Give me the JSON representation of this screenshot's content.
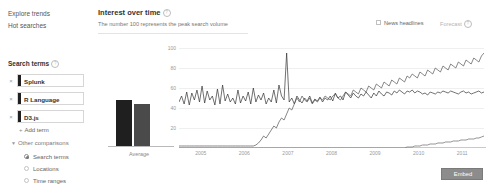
{
  "sidebar": {
    "nav": [
      {
        "label": "Explore trends"
      },
      {
        "label": "Hot searches"
      }
    ],
    "search_terms_heading": "Search terms",
    "help_glyph": "?",
    "remove_glyph": "×",
    "terms": [
      {
        "label": "Splunk",
        "color": "#1f1f1f"
      },
      {
        "label": "R Language",
        "color": "#1f1f1f"
      },
      {
        "label": "D3.js",
        "color": "#1f1f1f"
      }
    ],
    "add_term_label": "Add term",
    "add_term_glyph": "+",
    "other_comparisons_label": "Other comparisons",
    "other_comparisons_glyph": "▼",
    "comparison_options": [
      {
        "label": "Search terms",
        "selected": true
      },
      {
        "label": "Locations",
        "selected": false
      },
      {
        "label": "Time ranges",
        "selected": false
      }
    ]
  },
  "main": {
    "title": "Interest over time",
    "title_help_glyph": "?",
    "subtitle": "The number 100 represents the peak search volume",
    "news_headlines_label": "News headlines",
    "news_headlines_checked": false,
    "forecast_label": "Forecast",
    "forecast_help_glyph": "?",
    "embed_label": "Embed"
  },
  "chart_data": [
    {
      "type": "bar",
      "title": "",
      "categories": [
        "Average"
      ],
      "xlabel": "Average",
      "ylabel": "",
      "ylim": [
        0,
        100
      ],
      "series": [
        {
          "name": "Splunk",
          "values": [
            52
          ],
          "color": "#1f1f1f"
        },
        {
          "name": "R Language",
          "values": [
            48
          ],
          "color": "#4a4a4a"
        }
      ]
    },
    {
      "type": "line",
      "title": "Interest over time",
      "xlabel": "",
      "ylabel": "",
      "ylim": [
        0,
        100
      ],
      "yticks": [
        100,
        80,
        60,
        40,
        20
      ],
      "grid": true,
      "legend": "none",
      "x": [
        "2005",
        "2006",
        "2007",
        "2008",
        "2009",
        "2010",
        "2011"
      ],
      "xticks": [
        "2005",
        "2006",
        "2007",
        "2008",
        "2009",
        "2010",
        "2011"
      ],
      "series": [
        {
          "name": "Splunk",
          "color": "#333333",
          "values": [
            46,
            52,
            44,
            56,
            43,
            55,
            48,
            58,
            46,
            62,
            45,
            57,
            48,
            52,
            43,
            59,
            44,
            63,
            47,
            54,
            46,
            50,
            44,
            58,
            45,
            52,
            47,
            56,
            44,
            60,
            46,
            53,
            48,
            55,
            44,
            50,
            46,
            58,
            45,
            63,
            52,
            48,
            95,
            46,
            50,
            44,
            52,
            48,
            45,
            50,
            47,
            52,
            45,
            49,
            47,
            51,
            46,
            50,
            48,
            52,
            47,
            55,
            50,
            52,
            48,
            56,
            53,
            50,
            55,
            52,
            50,
            54,
            52,
            56,
            53,
            50,
            55,
            52,
            57,
            54,
            52,
            56,
            55,
            53,
            57,
            55,
            58,
            56,
            54,
            57,
            56,
            58,
            55,
            57,
            56,
            54,
            55,
            53,
            56,
            55,
            54,
            56,
            55,
            57,
            56,
            55,
            57,
            56,
            55,
            54,
            56,
            57,
            55,
            56,
            54,
            55,
            56,
            57,
            55,
            56
          ]
        },
        {
          "name": "R Language",
          "color": "#555555",
          "values": [
            2,
            2,
            2,
            2,
            2,
            2,
            2,
            2,
            2,
            2,
            2,
            2,
            2,
            2,
            2,
            2,
            2,
            2,
            2,
            2,
            2,
            2,
            2,
            2,
            2,
            2,
            2,
            2,
            2,
            2,
            3,
            5,
            8,
            12,
            10,
            14,
            18,
            22,
            20,
            26,
            30,
            28,
            34,
            40,
            38,
            44,
            50,
            46,
            52,
            48,
            46,
            50,
            44,
            48,
            46,
            50,
            48,
            52,
            50,
            48,
            52,
            54,
            50,
            48,
            52,
            56,
            54,
            52,
            58,
            56,
            54,
            60,
            58,
            56,
            62,
            60,
            58,
            64,
            62,
            60,
            66,
            64,
            62,
            68,
            66,
            64,
            70,
            68,
            66,
            72,
            70,
            74,
            72,
            70,
            76,
            74,
            72,
            78,
            76,
            74,
            80,
            78,
            76,
            82,
            80,
            78,
            84,
            82,
            80,
            86,
            84,
            82,
            88,
            86,
            84,
            90,
            88,
            86,
            92,
            95
          ]
        },
        {
          "name": "D3.js",
          "color": "#666666",
          "values": [
            0,
            0,
            0,
            0,
            0,
            0,
            0,
            0,
            0,
            0,
            0,
            0,
            0,
            0,
            0,
            0,
            0,
            0,
            0,
            0,
            0,
            0,
            0,
            0,
            0,
            0,
            0,
            0,
            0,
            0,
            0,
            0,
            0,
            0,
            0,
            0,
            0,
            0,
            0,
            0,
            0,
            0,
            0,
            0,
            0,
            0,
            0,
            0,
            0,
            0,
            0,
            0,
            0,
            0,
            0,
            0,
            0,
            0,
            0,
            0,
            0,
            0,
            0,
            0,
            0,
            0,
            0,
            0,
            0,
            0,
            0,
            0,
            0,
            0,
            0,
            0,
            0,
            0,
            0,
            0,
            0,
            0,
            0,
            0,
            0,
            0,
            0,
            0,
            0,
            1,
            1,
            1,
            2,
            2,
            2,
            3,
            3,
            3,
            4,
            4,
            4,
            5,
            5,
            5,
            6,
            6,
            6,
            7,
            7,
            7,
            8,
            8,
            8,
            9,
            9,
            9,
            10,
            10,
            11,
            12
          ]
        }
      ]
    }
  ]
}
